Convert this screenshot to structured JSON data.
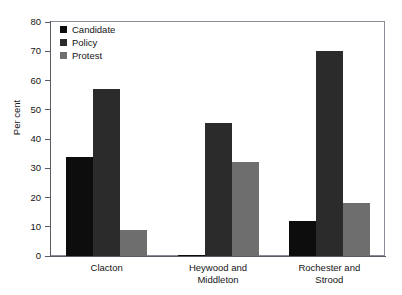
{
  "chart_data": {
    "type": "bar",
    "title": "",
    "xlabel": "",
    "ylabel": "Per cent",
    "ylim": [
      0,
      80
    ],
    "ytick_step": 10,
    "yticks": [
      0,
      10,
      20,
      30,
      40,
      50,
      60,
      70,
      80
    ],
    "grid": false,
    "legend_position": "top-left",
    "categories": [
      "Clacton",
      "Heywood and Middleton",
      "Rochester and Strood"
    ],
    "category_lines": [
      [
        "Clacton"
      ],
      [
        "Heywood and",
        "Middleton"
      ],
      [
        "Rochester and",
        "Strood"
      ]
    ],
    "series": [
      {
        "name": "Candidate",
        "color": "#0d0d0d",
        "values": [
          34,
          0.5,
          12
        ]
      },
      {
        "name": "Policy",
        "color": "#2b2b2b",
        "values": [
          57,
          45.5,
          70
        ]
      },
      {
        "name": "Protest",
        "color": "#6e6e6e",
        "values": [
          9,
          32,
          18
        ]
      }
    ]
  },
  "axes": {
    "frame_color": "#8c8c98",
    "axis_color": "#5a5a63",
    "text_color": "#141414",
    "background": "#ffffff"
  }
}
